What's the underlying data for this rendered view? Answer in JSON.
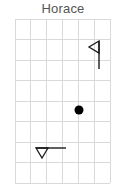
{
  "title": "Horace",
  "colors": {
    "background": "#ffffff",
    "grid_line": "#d9d9d9",
    "title_text": "#555555",
    "marker": "#000000",
    "flag_stroke": "#1a1a1a"
  },
  "chart_data": {
    "type": "scatter",
    "title": "Horace",
    "xlabel": "",
    "ylabel": "",
    "grid": true,
    "legend": null,
    "plot_area": {
      "x": 15,
      "y": 19,
      "width": 95,
      "height": 164
    },
    "grid_columns": 6,
    "grid_rows": 8,
    "xlim": [
      0,
      6
    ],
    "ylim": [
      0,
      8
    ],
    "xticklabels": [],
    "yticklabels": [],
    "series": [
      {
        "name": "point-marker",
        "marker": "filled-circle",
        "color": "#000000",
        "radius": 4.5,
        "points": [
          {
            "x": 4.03,
            "y": 4.66
          }
        ],
        "pixels": [
          {
            "cx": 79,
            "cy": 110
          }
        ]
      },
      {
        "name": "flag-upright",
        "marker": "flag-pointing-left",
        "color": "#1a1a1a",
        "points": [
          {
            "x": 5.3,
            "y": 5.6
          }
        ],
        "pixels": {
          "pole_x": 99,
          "pole_top_y": 41,
          "pole_bottom_y": 69,
          "banner_tip_x": 89,
          "banner_mid_y": 47,
          "banner_bottom_y": 53
        }
      },
      {
        "name": "flag-horizontal",
        "marker": "flag-pointing-down",
        "color": "#1a1a1a",
        "points": [
          {
            "x": 1.4,
            "y": 1.7
          }
        ],
        "pixels": {
          "pole_y": 148,
          "pole_left_x": 36,
          "pole_right_x": 66,
          "banner_tip_y": 158,
          "banner_mid_x": 42,
          "banner_right_x": 48
        }
      }
    ]
  }
}
